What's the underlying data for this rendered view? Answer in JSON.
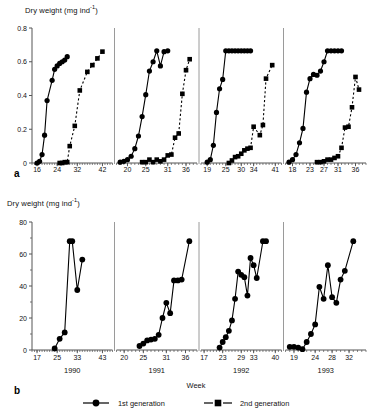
{
  "figure": {
    "ylabel_a": "Dry weight (mg ind",
    "ylabel_a_sup": "-1",
    "ylabel_a_close": ")",
    "ylabel_b": "Dry weight (mg ind",
    "ylabel_b_sup": "-1",
    "ylabel_b_close": ")",
    "panel_a_letter": "a",
    "panel_b_letter": "b",
    "xlabel": "Week",
    "legend": [
      {
        "label": "1st generation",
        "marker": "circle",
        "line": "solid",
        "color": "#000000"
      },
      {
        "label": "2nd generation",
        "marker": "square",
        "line": "dashed",
        "color": "#000000"
      }
    ],
    "years": [
      "1990",
      "1991",
      "1992",
      "1993"
    ],
    "divider_color": "#9a9a9a",
    "axis_color": "#555555",
    "series_color": "#000000"
  },
  "chart_data": [
    {
      "type": "line",
      "id": "panel-a",
      "title": "",
      "xlabel": "Week",
      "ylabel": "Dry weight (mg ind-1)",
      "ylim": [
        0,
        0.8
      ],
      "yticks": [
        0,
        0.2,
        0.4,
        0.6,
        0.8
      ],
      "yticklabels": [
        "0",
        "0.2",
        "0.4",
        "0.6",
        "0.8"
      ],
      "grid": false,
      "legend_position": "bottom",
      "panels": [
        {
          "year": "1990",
          "xlim": [
            14,
            46
          ],
          "xticks": [
            16,
            24,
            32,
            42
          ],
          "xticklabels": [
            "16",
            "24",
            "32",
            "42"
          ],
          "series": [
            {
              "name": "1st generation",
              "marker": "circle",
              "line": "solid",
              "x": [
                16,
                17,
                18,
                19,
                20,
                22,
                23,
                24,
                25,
                26,
                27,
                28
              ],
              "y": [
                0.0,
                0.01,
                0.05,
                0.165,
                0.37,
                0.49,
                0.555,
                0.575,
                0.59,
                0.6,
                0.61,
                0.63
              ]
            },
            {
              "name": "2nd generation",
              "marker": "square",
              "line": "dashed",
              "x": [
                25,
                26,
                27,
                28,
                29,
                31,
                33,
                36,
                38,
                40,
                42
              ],
              "y": [
                0.0,
                0.0,
                0.005,
                0.005,
                0.1,
                0.22,
                0.43,
                0.54,
                0.58,
                0.62,
                0.66
              ]
            }
          ]
        },
        {
          "year": "1991",
          "xlim": [
            17,
            39
          ],
          "xticks": [
            20,
            25,
            31,
            36
          ],
          "xticklabels": [
            "20",
            "25",
            "31",
            "36"
          ],
          "series": [
            {
              "name": "1st generation",
              "marker": "circle",
              "line": "solid",
              "x": [
                18,
                19,
                20,
                21,
                22,
                23,
                24,
                25,
                26,
                27,
                28,
                29,
                30,
                31
              ],
              "y": [
                0.005,
                0.01,
                0.02,
                0.04,
                0.085,
                0.16,
                0.275,
                0.405,
                0.545,
                0.6,
                0.665,
                0.575,
                0.66,
                0.665
              ]
            },
            {
              "name": "2nd generation",
              "marker": "square",
              "line": "dashed",
              "x": [
                24,
                25,
                26,
                27,
                28,
                29,
                30,
                31,
                32,
                33,
                34,
                35,
                36,
                37
              ],
              "y": [
                0.005,
                0.005,
                0.02,
                0.005,
                0.02,
                0.01,
                0.02,
                0.045,
                0.05,
                0.15,
                0.175,
                0.41,
                0.55,
                0.615
              ]
            }
          ]
        },
        {
          "year": "1992",
          "xlim": [
            17,
            43
          ],
          "xticks": [
            19,
            25,
            30,
            34,
            41
          ],
          "xticklabels": [
            "19",
            "25",
            "30",
            "34",
            "41"
          ],
          "series": [
            {
              "name": "1st generation",
              "marker": "circle",
              "line": "solid",
              "x": [
                19,
                20,
                21,
                22,
                23,
                24,
                25,
                26,
                27,
                28,
                29,
                30,
                31,
                32,
                33
              ],
              "y": [
                0.005,
                0.02,
                0.105,
                0.3,
                0.44,
                0.495,
                0.665,
                0.665,
                0.665,
                0.665,
                0.665,
                0.665,
                0.665,
                0.665,
                0.665
              ]
            },
            {
              "name": "2nd generation",
              "marker": "square",
              "line": "dashed",
              "x": [
                26,
                27,
                28,
                29,
                30,
                31,
                32,
                33,
                34,
                36,
                37,
                38,
                40
              ],
              "y": [
                0.0,
                0.015,
                0.035,
                0.04,
                0.055,
                0.075,
                0.085,
                0.09,
                0.215,
                0.165,
                0.225,
                0.5,
                0.58
              ]
            }
          ]
        },
        {
          "year": "1993",
          "xlim": [
            16,
            39
          ],
          "xticks": [
            18,
            23,
            27,
            31,
            36
          ],
          "xticklabels": [
            "18",
            "23",
            "27",
            "31",
            "36"
          ],
          "series": [
            {
              "name": "1st generation",
              "marker": "circle",
              "line": "solid",
              "x": [
                17,
                18,
                19,
                20,
                21,
                22,
                23,
                24,
                25,
                26,
                27,
                28,
                29,
                30,
                31,
                32
              ],
              "y": [
                0.005,
                0.02,
                0.05,
                0.12,
                0.205,
                0.42,
                0.5,
                0.525,
                0.52,
                0.545,
                0.6,
                0.665,
                0.665,
                0.665,
                0.665,
                0.665
              ]
            },
            {
              "name": "2nd generation",
              "marker": "square",
              "line": "dashed",
              "x": [
                25,
                26,
                27,
                28,
                29,
                30,
                31,
                32,
                33,
                34,
                35,
                36,
                37
              ],
              "y": [
                0.005,
                0.005,
                0.01,
                0.02,
                0.02,
                0.03,
                0.04,
                0.09,
                0.21,
                0.215,
                0.33,
                0.51,
                0.435
              ]
            }
          ]
        }
      ]
    },
    {
      "type": "line",
      "id": "panel-b",
      "title": "",
      "xlabel": "Week",
      "ylabel": "Dry weight (mg ind-1)",
      "ylim": [
        0,
        80
      ],
      "yticks": [
        0,
        20,
        40,
        60,
        80
      ],
      "yticklabels": [
        "0",
        "20",
        "40",
        "60",
        "80"
      ],
      "grid": false,
      "legend_position": "bottom",
      "panels": [
        {
          "year": "1990",
          "xlim": [
            15,
            47
          ],
          "xticks": [
            17,
            25,
            33,
            43
          ],
          "xticklabels": [
            "17",
            "25",
            "33",
            "43"
          ],
          "series": [
            {
              "name": "1st generation",
              "marker": "circle",
              "line": "solid",
              "x": [
                24,
                26,
                28,
                30,
                31,
                33,
                35
              ],
              "y": [
                1,
                7,
                11,
                68,
                68,
                37.5,
                56.5
              ]
            }
          ]
        },
        {
          "year": "1991",
          "xlim": [
            18,
            39
          ],
          "xticks": [
            20,
            25,
            31,
            36
          ],
          "xticklabels": [
            "20",
            "25",
            "31",
            "36"
          ],
          "series": [
            {
              "name": "1st generation",
              "marker": "circle",
              "line": "solid",
              "x": [
                24,
                25,
                26,
                27,
                28,
                29,
                30,
                31,
                32,
                33,
                34,
                35,
                37
              ],
              "y": [
                2.5,
                4,
                6,
                6.5,
                7,
                9.5,
                20,
                29.5,
                23,
                43.5,
                43.5,
                44,
                68
              ]
            }
          ]
        },
        {
          "year": "1992",
          "xlim": [
            16,
            42
          ],
          "xticks": [
            17,
            23,
            29,
            33,
            40
          ],
          "xticklabels": [
            "17",
            "23",
            "29",
            "33",
            "40"
          ],
          "series": [
            {
              "name": "1st generation",
              "marker": "circle",
              "line": "solid",
              "x": [
                22,
                23,
                24,
                25,
                26,
                27,
                28,
                29,
                30,
                31,
                32,
                33,
                34,
                36,
                37
              ],
              "y": [
                1.5,
                5,
                8,
                12,
                18.5,
                32,
                49,
                47,
                45.5,
                34,
                57.5,
                53,
                45,
                68,
                68
              ]
            }
          ]
        },
        {
          "year": "1993",
          "xlim": [
            17,
            36
          ],
          "xticks": [
            19,
            24,
            28,
            32
          ],
          "xticklabels": [
            "19",
            "24",
            "28",
            "32"
          ],
          "series": [
            {
              "name": "1st generation",
              "marker": "circle",
              "line": "solid",
              "x": [
                18,
                19,
                20,
                21,
                22,
                23,
                24,
                25,
                26,
                27,
                28,
                29,
                30,
                31,
                33
              ],
              "y": [
                2,
                2,
                1.5,
                0.5,
                5,
                10,
                16,
                39.5,
                32,
                53,
                33,
                29.5,
                44,
                49.5,
                68
              ]
            }
          ]
        }
      ]
    }
  ]
}
